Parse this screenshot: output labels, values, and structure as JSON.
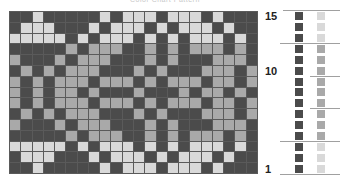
{
  "title": "Color Chart Pattern",
  "colors": {
    "D": "#4b4b4b",
    "G": "#a9a9a9",
    "L": "#d9d9d9"
  },
  "grid": {
    "columns": 22,
    "rows_count": 15,
    "rows_top_to_bottom": [
      "DDLDDDDDLDLLLDLLLDLDDD",
      "DLLLDDDLDLLLDLDLLLDLDD",
      "LLLLLDLDLLLDLDLDLLLDLD",
      "DDDDDGDGGGDDGDGDGGGDGD",
      "GDDDGDGGGDDDGDGDDDGGGD",
      "DGDGDGGGDDDGDGDDDGGGDG",
      "GDGDGGGDGGGDGDGGGDGGDG",
      "GDGDGGDGDDDGDDDGDGGDGD",
      "GDGDGGGDGGGDGDGGGDGGDG",
      "DGDGDGGGDDDGDGDDDGGGDG",
      "GDDDGDGGGDDDGDGDDDGGGD",
      "DDDDDGDGGGDDGDGDGGGDGD",
      "LLLLLDLDLLLDLDLDLLLDLD",
      "DLLLDDDLDLLLDLDLLLDLDD",
      "DDLDDDDDLDLLLDLLLDLDDD"
    ]
  },
  "row_labels": [
    {
      "text": "15",
      "row": 15
    },
    {
      "text": "10",
      "row": 10
    },
    {
      "text": "1",
      "row": 1
    }
  ],
  "legend": {
    "contrast_color_column": [
      "D",
      "D",
      "D",
      "D",
      "D",
      "D",
      "D",
      "D",
      "D",
      "D",
      "D",
      "D",
      "D",
      "D",
      "D"
    ],
    "background_color_column": [
      "L",
      "L",
      "L",
      "G",
      "G",
      "G",
      "G",
      "G",
      "G",
      "G",
      "G",
      "G",
      "L",
      "L",
      "L"
    ]
  }
}
